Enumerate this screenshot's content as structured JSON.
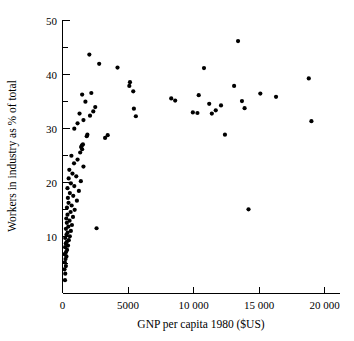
{
  "chart_data": {
    "type": "scatter",
    "title": "",
    "xlabel": "GNP per capita 1980 ($US)",
    "ylabel": "Workers in industry as % of total",
    "xlim": [
      0,
      20000
    ],
    "ylim": [
      0,
      50
    ],
    "grid": false,
    "legend": null,
    "xticks": [
      0,
      5000,
      10000,
      15000,
      20000
    ],
    "xtick_labels": [
      "0",
      "5000",
      "10 000",
      "15 000",
      "20 000"
    ],
    "yticks": [
      10,
      20,
      30,
      40,
      50
    ],
    "ytick_labels": [
      "10",
      "20",
      "30",
      "40",
      "50"
    ],
    "y_minor_ticks": [
      5,
      15,
      25,
      35,
      45
    ],
    "marker": "filled-circle",
    "marker_color": "#000000",
    "points": [
      [
        190,
        2.0
      ],
      [
        210,
        3.2
      ],
      [
        150,
        4.0
      ],
      [
        260,
        4.6
      ],
      [
        180,
        5.3
      ],
      [
        230,
        5.9
      ],
      [
        300,
        6.4
      ],
      [
        160,
        6.8
      ],
      [
        270,
        7.2
      ],
      [
        350,
        7.6
      ],
      [
        200,
        8.1
      ],
      [
        420,
        8.4
      ],
      [
        250,
        8.8
      ],
      [
        330,
        9.1
      ],
      [
        480,
        9.4
      ],
      [
        210,
        9.8
      ],
      [
        560,
        10.1
      ],
      [
        300,
        10.4
      ],
      [
        390,
        10.8
      ],
      [
        640,
        11.1
      ],
      [
        260,
        11.5
      ],
      [
        450,
        11.9
      ],
      [
        720,
        12.2
      ],
      [
        330,
        12.6
      ],
      [
        540,
        13.0
      ],
      [
        290,
        13.4
      ],
      [
        800,
        13.7
      ],
      [
        380,
        14.1
      ],
      [
        620,
        14.6
      ],
      [
        930,
        15.0
      ],
      [
        340,
        15.4
      ],
      [
        700,
        15.8
      ],
      [
        460,
        16.3
      ],
      [
        1100,
        16.7
      ],
      [
        410,
        17.2
      ],
      [
        820,
        17.6
      ],
      [
        560,
        18.1
      ],
      [
        1250,
        18.5
      ],
      [
        380,
        19.0
      ],
      [
        900,
        19.4
      ],
      [
        640,
        19.9
      ],
      [
        1400,
        20.3
      ],
      [
        470,
        20.8
      ],
      [
        1050,
        21.2
      ],
      [
        760,
        21.7
      ],
      [
        520,
        22.4
      ],
      [
        1600,
        23.0
      ],
      [
        880,
        23.6
      ],
      [
        1150,
        24.3
      ],
      [
        680,
        25.0
      ],
      [
        1350,
        25.6
      ],
      [
        1500,
        26.2
      ],
      [
        1420,
        26.6
      ],
      [
        1480,
        26.9
      ],
      [
        1560,
        27.1
      ],
      [
        1850,
        28.6
      ],
      [
        1900,
        28.9
      ],
      [
        3250,
        28.3
      ],
      [
        3450,
        28.8
      ],
      [
        2600,
        11.6
      ],
      [
        900,
        30.0
      ],
      [
        1150,
        31.0
      ],
      [
        1600,
        31.6
      ],
      [
        2100,
        32.4
      ],
      [
        1300,
        32.8
      ],
      [
        2350,
        33.2
      ],
      [
        2500,
        34.0
      ],
      [
        1750,
        35.0
      ],
      [
        1500,
        36.3
      ],
      [
        2200,
        36.6
      ],
      [
        2800,
        42.0
      ],
      [
        2050,
        43.7
      ],
      [
        4200,
        41.3
      ],
      [
        5100,
        37.9
      ],
      [
        5150,
        38.6
      ],
      [
        5400,
        36.9
      ],
      [
        5450,
        33.7
      ],
      [
        5600,
        32.3
      ],
      [
        8300,
        35.6
      ],
      [
        8600,
        35.2
      ],
      [
        9950,
        33.0
      ],
      [
        10300,
        32.9
      ],
      [
        10400,
        36.2
      ],
      [
        10800,
        41.2
      ],
      [
        11200,
        34.6
      ],
      [
        11400,
        32.8
      ],
      [
        11700,
        33.4
      ],
      [
        12100,
        34.3
      ],
      [
        12400,
        28.9
      ],
      [
        13100,
        37.9
      ],
      [
        13700,
        35.1
      ],
      [
        13900,
        33.8
      ],
      [
        13400,
        46.2
      ],
      [
        14200,
        15.1
      ],
      [
        15100,
        36.5
      ],
      [
        16300,
        35.9
      ],
      [
        18800,
        39.3
      ],
      [
        19000,
        31.4
      ]
    ]
  }
}
